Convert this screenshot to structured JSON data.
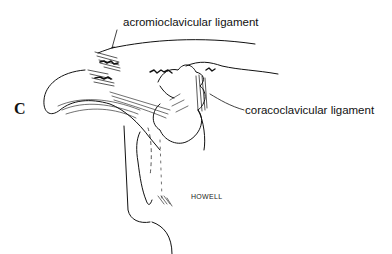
{
  "figure": {
    "panel_letter": "C",
    "labels": {
      "acromioclavicular": "acromioclavicular ligament",
      "coracoclavicular": "coracoclavicular ligament"
    },
    "signature": "HOWELL",
    "colors": {
      "ink": "#111111",
      "background": "#ffffff"
    }
  }
}
